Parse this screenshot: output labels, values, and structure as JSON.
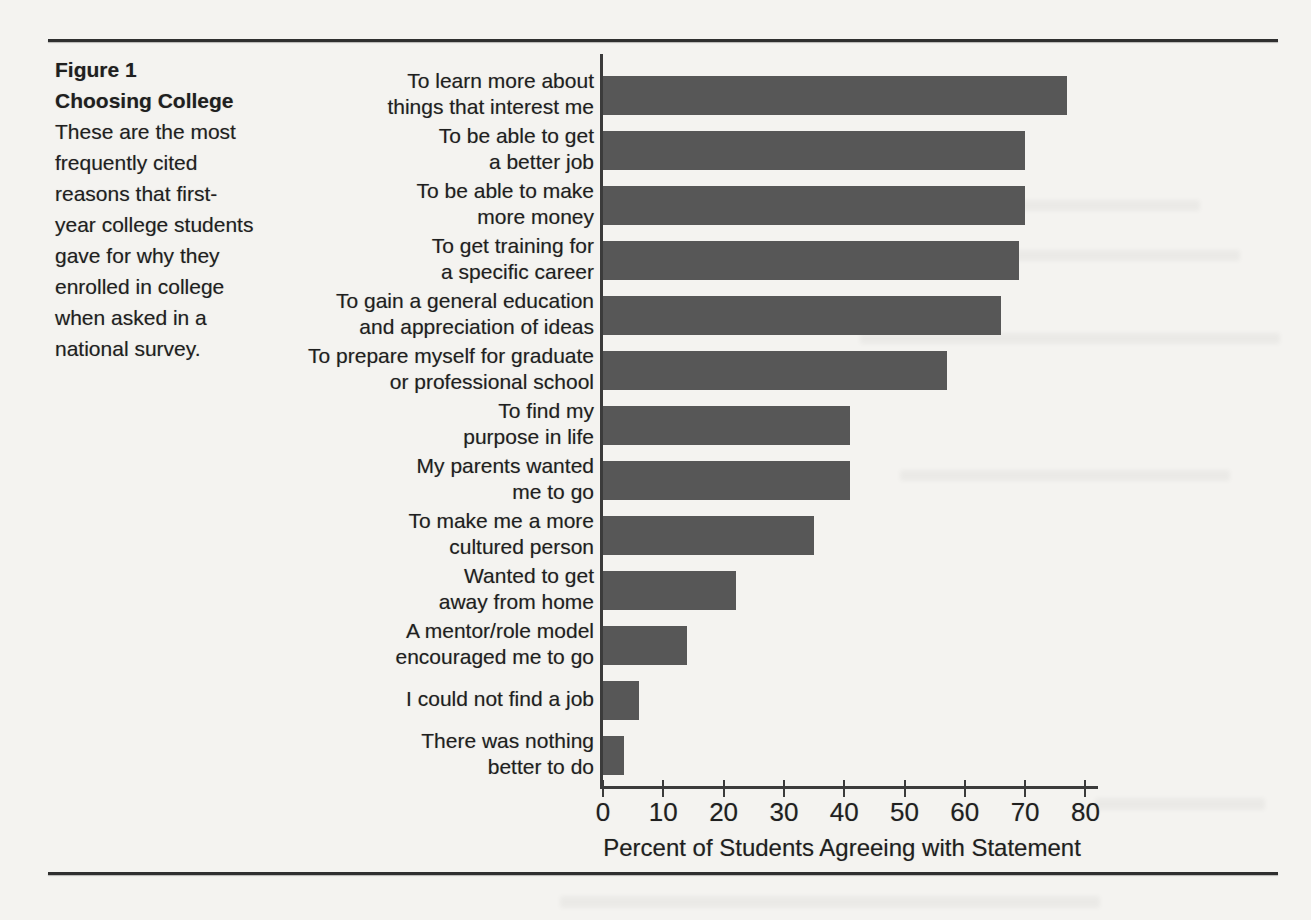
{
  "page": {
    "background_color": "#f4f3f0",
    "ink_color": "#1f1f1f"
  },
  "figure": {
    "label": "Figure 1",
    "title": "Choosing College",
    "caption_lines": [
      "These are the most",
      "frequently cited",
      "reasons that first-",
      "year college students",
      "gave for why they",
      "enrolled in college",
      "when asked in a",
      "national survey."
    ]
  },
  "chart_data": {
    "type": "bar",
    "orientation": "horizontal",
    "title": "",
    "xlabel": "Percent of Students Agreeing with Statement",
    "ylabel": "",
    "xlim": [
      0,
      85
    ],
    "x_ticks": [
      0,
      10,
      20,
      30,
      40,
      50,
      60,
      70,
      80
    ],
    "grid": false,
    "bar_color": "#575757",
    "categories": [
      "To learn more about things that interest me",
      "To be able to get a better job",
      "To be able to make more money",
      "To get training for a specific career",
      "To gain a general education and appreciation of ideas",
      "To prepare myself for graduate or professional school",
      "To find my purpose in life",
      "My parents wanted me to go",
      "To make me a more cultured person",
      "Wanted to get away from home",
      "A mentor/role model encouraged me to go",
      "I could not find a job",
      "There was nothing better to do"
    ],
    "category_label_lines": [
      [
        "To learn more about",
        "things that interest me"
      ],
      [
        "To be able to get",
        "a better job"
      ],
      [
        "To be able to make",
        "more money"
      ],
      [
        "To get training for",
        "a specific career"
      ],
      [
        "To gain a general education",
        "and appreciation of ideas"
      ],
      [
        "To prepare myself for graduate",
        "or professional school"
      ],
      [
        "To find my",
        "purpose in life"
      ],
      [
        "My parents wanted",
        "me to go"
      ],
      [
        "To make me a more",
        "cultured person"
      ],
      [
        "Wanted to get",
        "away from home"
      ],
      [
        "A mentor/role model",
        "encouraged me to go"
      ],
      [
        "I could not find a job"
      ],
      [
        "There was nothing",
        "better to do"
      ]
    ],
    "values": [
      77,
      70,
      70,
      69,
      66,
      57,
      41,
      41,
      35,
      22,
      14,
      6,
      3.5
    ]
  }
}
